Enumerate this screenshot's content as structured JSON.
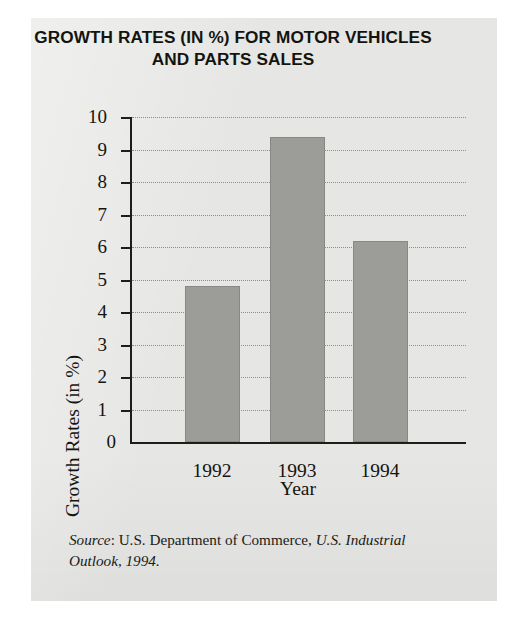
{
  "figure": {
    "title_line1": "GROWTH RATES (IN %) FOR MOTOR VEHICLES",
    "title_line2": "AND PARTS SALES",
    "source_label": "Source",
    "source_sep": ": ",
    "source_publisher": "U.S. Department of Commerce, ",
    "source_work": "U.S. Industrial Outlook, 1994.",
    "panel_color": "#e6e6e4",
    "bar_color": "#9c9c99",
    "axis_color": "#1d1d19",
    "grid_color": "#8e8e88"
  },
  "chart_data": {
    "type": "bar",
    "title": "GROWTH RATES (IN %) FOR MOTOR VEHICLES AND PARTS SALES",
    "xlabel": "Year",
    "ylabel": "Growth Rates (in %)",
    "categories": [
      "1992",
      "1993",
      "1994"
    ],
    "values": [
      4.8,
      9.4,
      6.2
    ],
    "ylim": [
      0,
      10
    ],
    "yticks": [
      0,
      1,
      2,
      3,
      4,
      5,
      6,
      7,
      8,
      9,
      10
    ],
    "ytick_labels": [
      "0",
      "1",
      "2",
      "3",
      "4",
      "5",
      "6",
      "7",
      "8",
      "9",
      "10"
    ],
    "grid": true,
    "grid_style": "dotted-horizontal",
    "legend": null,
    "series": [
      {
        "name": "Growth Rates (in %)",
        "values": [
          4.8,
          9.4,
          6.2
        ]
      }
    ]
  }
}
